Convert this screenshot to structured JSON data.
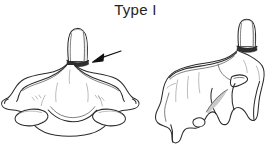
{
  "figure": {
    "title": "Type I",
    "background_color": "#ffffff",
    "ink_color": "#2b2b2b",
    "fracture_band_color": "#303030",
    "arrow_color": "#111111",
    "panels": [
      {
        "id": "left-panel",
        "view_label": "anterior view of axis vertebra with odontoid process",
        "has_fracture_band": true,
        "has_arrow_annotation": true
      },
      {
        "id": "right-panel",
        "view_label": "lateral oblique view of axis vertebra with odontoid process",
        "has_fracture_band": true,
        "has_arrow_annotation": false
      }
    ],
    "annotations": [
      {
        "id": "fracture-arrow",
        "label": "arrow indicating oblique fracture at tip of odontoid process",
        "points_to": "odontoid-tip-fracture-line"
      }
    ]
  }
}
